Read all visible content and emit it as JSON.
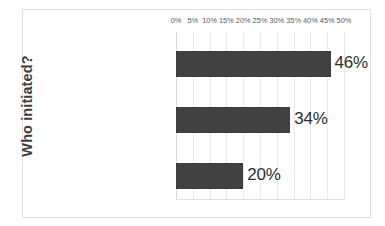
{
  "chart_data": {
    "type": "bar",
    "orientation": "horizontal",
    "title": "",
    "xlabel": "",
    "ylabel": "Who initiated?",
    "categories": [
      "Joining Church",
      "Lead Church",
      "Other (such as a denominational official)"
    ],
    "values": [
      46,
      34,
      20
    ],
    "data_labels": [
      "46%",
      "34%",
      "20%"
    ],
    "xlim": [
      0,
      50
    ],
    "xticks": [
      0,
      5,
      10,
      15,
      20,
      25,
      30,
      35,
      40,
      45,
      50
    ],
    "xtick_labels": [
      "0%",
      "5%",
      "10%",
      "15%",
      "20%",
      "25%",
      "30%",
      "35%",
      "40%",
      "45%",
      "50%"
    ],
    "xaxis_position": "top",
    "grid": true,
    "grid_axis": "x",
    "legend": false,
    "series": [
      {
        "name": "Who initiated?",
        "values": [
          46,
          34,
          20
        ],
        "color": "#404040"
      }
    ],
    "colors": {
      "bar": "#404040",
      "gridline": "#e9e9e9",
      "border": "#e2e2e2",
      "data_label": "#2e2e2e",
      "tick_label": "#59595b",
      "category_label": "#4a4a4a",
      "axis_title": "#3d3d3d",
      "background": "#ffffff"
    }
  }
}
